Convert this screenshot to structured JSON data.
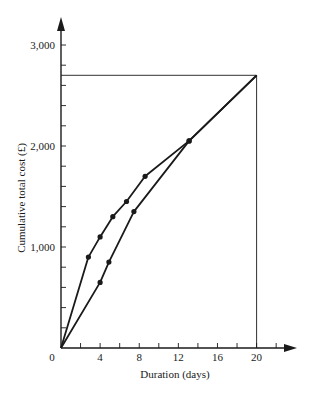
{
  "chart_data": {
    "type": "line",
    "title": "",
    "xlabel": "Duration (days)",
    "ylabel": "Cumulative total cost (£)",
    "xlim": [
      0,
      24
    ],
    "ylim": [
      0,
      3200
    ],
    "grid": false,
    "legend": null,
    "x_ticks": [
      {
        "value": 0,
        "label": "0"
      },
      {
        "value": 4,
        "label": "4"
      },
      {
        "value": 8,
        "label": "8"
      },
      {
        "value": 12,
        "label": "12"
      },
      {
        "value": 16,
        "label": "16"
      },
      {
        "value": 20,
        "label": "20"
      }
    ],
    "x_minor_tick_step": 2,
    "y_ticks": [
      {
        "value": 1000,
        "label": "1,000"
      },
      {
        "value": 2000,
        "label": "2,000"
      },
      {
        "value": 3000,
        "label": "3,000"
      }
    ],
    "y_minor_tick_step": 200,
    "series": [
      {
        "name": "upper curve",
        "points": [
          [
            0,
            0
          ],
          [
            2.8,
            900
          ],
          [
            4.0,
            1100
          ],
          [
            5.3,
            1300
          ],
          [
            6.7,
            1450
          ],
          [
            8.6,
            1700
          ],
          [
            13.1,
            2050
          ],
          [
            20,
            2700
          ]
        ],
        "markers": [
          [
            2.8,
            900
          ],
          [
            4.0,
            1100
          ],
          [
            5.3,
            1300
          ],
          [
            6.7,
            1450
          ],
          [
            8.6,
            1700
          ],
          [
            13.1,
            2050
          ]
        ]
      },
      {
        "name": "lower curve",
        "points": [
          [
            0,
            0
          ],
          [
            4.0,
            650
          ],
          [
            4.9,
            850
          ],
          [
            7.45,
            1350
          ],
          [
            13.1,
            2050
          ],
          [
            20,
            2700
          ]
        ],
        "markers": [
          [
            4.0,
            650
          ],
          [
            4.9,
            850
          ],
          [
            7.45,
            1350
          ],
          [
            13.1,
            2050
          ]
        ]
      }
    ],
    "reference_lines": [
      {
        "orientation": "horizontal",
        "value": 2700,
        "from_x": 0,
        "to_x": 20
      },
      {
        "orientation": "vertical",
        "value": 20,
        "from_y": 0,
        "to_y": 2700
      }
    ],
    "line_color": "#1a1a1a"
  }
}
